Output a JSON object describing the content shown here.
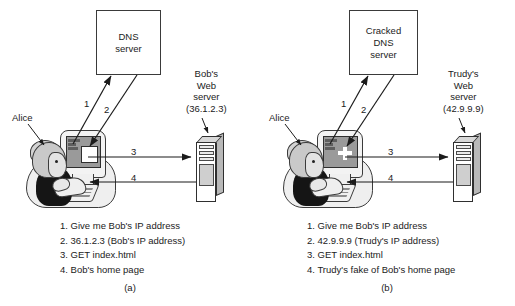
{
  "figure": {
    "type": "network-security-diagram",
    "panels": [
      {
        "id": "a",
        "caption": "(a)",
        "dns_server": {
          "lines": [
            "DNS",
            "server"
          ]
        },
        "web_server": {
          "lines": [
            "Bob's",
            "Web",
            "server",
            "(36.1.2.3)"
          ]
        },
        "user_label": "Alice",
        "arrows": [
          {
            "number": "1",
            "direction": "client-to-dns"
          },
          {
            "number": "2",
            "direction": "dns-to-client"
          },
          {
            "number": "3",
            "direction": "client-to-web"
          },
          {
            "number": "4",
            "direction": "web-to-client"
          }
        ],
        "legend": [
          "1. Give me Bob's IP address",
          "2. 36.1.2.3 (Bob's IP address)",
          "3. GET index.html",
          "4. Bob's home page"
        ]
      },
      {
        "id": "b",
        "caption": "(b)",
        "dns_server": {
          "lines": [
            "Cracked",
            "DNS",
            "server"
          ]
        },
        "web_server": {
          "lines": [
            "Trudy's",
            "Web",
            "server",
            "(42.9.9.9)"
          ]
        },
        "user_label": "Alice",
        "arrows": [
          {
            "number": "1",
            "direction": "client-to-dns"
          },
          {
            "number": "2",
            "direction": "dns-to-client"
          },
          {
            "number": "3",
            "direction": "client-to-web"
          },
          {
            "number": "4",
            "direction": "web-to-client"
          }
        ],
        "legend": [
          "1. Give me Bob's IP address",
          "2. 42.9.9.9 (Trudy's IP address)",
          "3. GET index.html",
          "4. Trudy's fake of Bob's home page"
        ]
      }
    ],
    "colors": {
      "background": "#ffffff",
      "stroke": "#1b1b1b",
      "box_fill": "#ffffff",
      "server_side": "#b9b9b9",
      "screen": "#9a9a9a",
      "torso": "#151515"
    }
  }
}
